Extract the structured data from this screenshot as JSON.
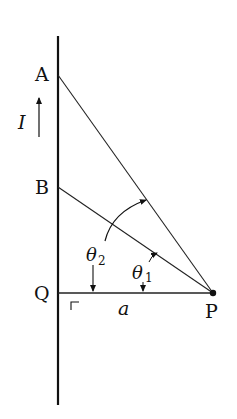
{
  "diagram": {
    "type": "geometry-physics",
    "points": {
      "A": {
        "label": "A",
        "x": 58,
        "y": 75
      },
      "B": {
        "label": "B",
        "x": 58,
        "y": 187
      },
      "Q": {
        "label": "Q",
        "x": 58,
        "y": 293
      },
      "P": {
        "label": "P",
        "x": 213,
        "y": 293
      }
    },
    "labels": {
      "A": "A",
      "B": "B",
      "Q": "Q",
      "P": "P",
      "current": "I",
      "distance": "a",
      "theta1": "θ",
      "theta1_sub": "1",
      "theta2": "θ",
      "theta2_sub": "2"
    },
    "segments": [
      {
        "name": "wire",
        "from": [
          58,
          36
        ],
        "to": [
          58,
          405
        ]
      },
      {
        "name": "AP",
        "from": "A",
        "to": "P"
      },
      {
        "name": "BP",
        "from": "B",
        "to": "P"
      },
      {
        "name": "QP",
        "from": "Q",
        "to": "P"
      }
    ],
    "annotations": {
      "current_direction": "up",
      "right_angle_at": "Q"
    },
    "colors": {
      "line": "#111111",
      "background": "#ffffff"
    }
  }
}
